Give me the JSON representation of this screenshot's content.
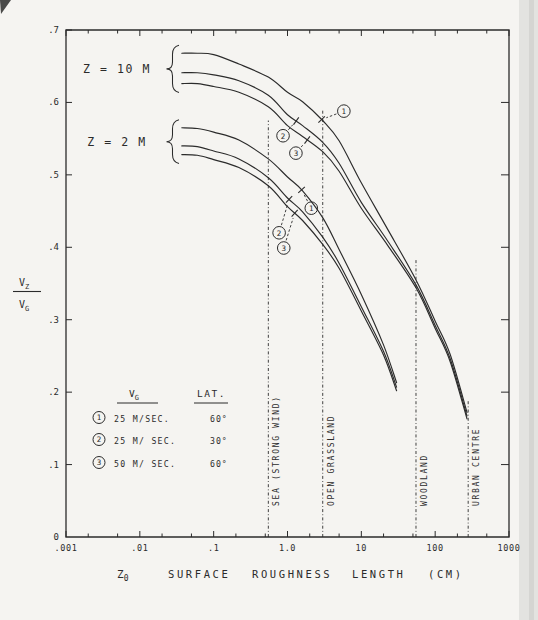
{
  "figure": {
    "background": "#f5f4f1",
    "ink": "#2b2b2b",
    "edge_band": "#e3e3e0",
    "edge_band_dark": "#d0d0cd"
  },
  "chart_data": {
    "type": "line",
    "title": "",
    "x_axis": {
      "scale": "log",
      "min": 0.001,
      "max": 1000,
      "decade_labels": [
        ".001",
        ".01",
        ".1",
        "1.0",
        "10",
        "100",
        "1000"
      ],
      "minor_tick_multiples": [
        2,
        5
      ],
      "title_parts": {
        "symbol": "Z",
        "symbol_sub": "0",
        "words": [
          "SURFACE",
          "ROUGHNESS",
          "LENGTH",
          "(CM)"
        ]
      }
    },
    "y_axis": {
      "min": 0,
      "max": 0.7,
      "step": 0.1,
      "tick_labels": [
        "0",
        ".1",
        ".2",
        ".3",
        ".4",
        ".5",
        ".6",
        ".7"
      ],
      "label": {
        "numerator": "V",
        "numerator_sub": "Z",
        "denominator": "V",
        "denominator_sub": "G"
      }
    },
    "groups": [
      {
        "label": "Z = 10 M",
        "series_indexes": [
          0,
          1,
          2
        ]
      },
      {
        "label": "Z = 2 M",
        "series_indexes": [
          3,
          4,
          5
        ]
      }
    ],
    "series": [
      {
        "name": "Z=10M, VG 25 M/SEC, LAT 60",
        "num": "1",
        "points": [
          [
            0.037,
            0.668
          ],
          [
            0.06,
            0.668
          ],
          [
            0.1,
            0.666
          ],
          [
            0.22,
            0.653
          ],
          [
            0.55,
            0.635
          ],
          [
            1.0,
            0.614
          ],
          [
            1.6,
            0.601
          ],
          [
            3,
            0.575
          ],
          [
            5,
            0.547
          ],
          [
            10,
            0.489
          ],
          [
            23,
            0.424
          ],
          [
            55,
            0.355
          ],
          [
            100,
            0.298
          ],
          [
            160,
            0.252
          ],
          [
            270,
            0.172
          ]
        ]
      },
      {
        "name": "Z=10M, VG 25 M/SEC, LAT 30",
        "num": "2",
        "points": [
          [
            0.037,
            0.641
          ],
          [
            0.06,
            0.641
          ],
          [
            0.1,
            0.638
          ],
          [
            0.22,
            0.63
          ],
          [
            0.55,
            0.61
          ],
          [
            1.0,
            0.583
          ],
          [
            1.6,
            0.568
          ],
          [
            3,
            0.545
          ],
          [
            5,
            0.516
          ],
          [
            10,
            0.462
          ],
          [
            23,
            0.408
          ],
          [
            55,
            0.348
          ],
          [
            100,
            0.292
          ],
          [
            160,
            0.246
          ],
          [
            270,
            0.167
          ]
        ]
      },
      {
        "name": "Z=10M, VG 50 M/SEC, LAT 60",
        "num": "3",
        "points": [
          [
            0.037,
            0.626
          ],
          [
            0.06,
            0.626
          ],
          [
            0.1,
            0.622
          ],
          [
            0.22,
            0.614
          ],
          [
            0.55,
            0.594
          ],
          [
            1.0,
            0.568
          ],
          [
            1.6,
            0.553
          ],
          [
            3,
            0.532
          ],
          [
            5,
            0.505
          ],
          [
            10,
            0.454
          ],
          [
            23,
            0.402
          ],
          [
            55,
            0.344
          ],
          [
            100,
            0.288
          ],
          [
            160,
            0.242
          ],
          [
            270,
            0.163
          ]
        ]
      },
      {
        "name": "Z=2M, VG 25 M/SEC, LAT 60",
        "num": "1",
        "points": [
          [
            0.037,
            0.565
          ],
          [
            0.06,
            0.564
          ],
          [
            0.1,
            0.559
          ],
          [
            0.22,
            0.548
          ],
          [
            0.55,
            0.522
          ],
          [
            1.0,
            0.497
          ],
          [
            1.6,
            0.478
          ],
          [
            3,
            0.441
          ],
          [
            5,
            0.397
          ],
          [
            10,
            0.335
          ],
          [
            20,
            0.265
          ],
          [
            30,
            0.213
          ]
        ]
      },
      {
        "name": "Z=2M, VG 25 M/SEC, LAT 30",
        "num": "2",
        "points": [
          [
            0.037,
            0.54
          ],
          [
            0.06,
            0.539
          ],
          [
            0.1,
            0.533
          ],
          [
            0.22,
            0.522
          ],
          [
            0.55,
            0.496
          ],
          [
            1.0,
            0.468
          ],
          [
            1.6,
            0.449
          ],
          [
            3,
            0.414
          ],
          [
            5,
            0.378
          ],
          [
            10,
            0.318
          ],
          [
            20,
            0.256
          ],
          [
            30,
            0.207
          ]
        ]
      },
      {
        "name": "Z=2M, VG 50 M/SEC, LAT 60",
        "num": "3",
        "points": [
          [
            0.037,
            0.528
          ],
          [
            0.06,
            0.527
          ],
          [
            0.1,
            0.521
          ],
          [
            0.22,
            0.51
          ],
          [
            0.55,
            0.485
          ],
          [
            1.0,
            0.456
          ],
          [
            1.6,
            0.437
          ],
          [
            3,
            0.404
          ],
          [
            5,
            0.371
          ],
          [
            10,
            0.312
          ],
          [
            20,
            0.251
          ],
          [
            30,
            0.202
          ]
        ]
      }
    ],
    "annotations": [
      {
        "num": "1",
        "series": 0,
        "circle": {
          "x": 5.8,
          "y": 0.588
        },
        "target_x": 2.9
      },
      {
        "num": "2",
        "series": 1,
        "circle": {
          "x": 0.87,
          "y": 0.554
        },
        "target_x": 1.31
      },
      {
        "num": "3",
        "series": 2,
        "circle": {
          "x": 1.3,
          "y": 0.53
        },
        "target_x": 1.85
      },
      {
        "num": "1",
        "series": 3,
        "circle": {
          "x": 2.1,
          "y": 0.454
        },
        "target_x": 1.55
      },
      {
        "num": "2",
        "series": 4,
        "circle": {
          "x": 0.77,
          "y": 0.42
        },
        "target_x": 1.05
      },
      {
        "num": "3",
        "series": 5,
        "circle": {
          "x": 0.89,
          "y": 0.399
        },
        "target_x": 1.25
      }
    ],
    "reference_lines": [
      {
        "label": "SEA  (STRONG  WIND)",
        "x": 0.55,
        "top": 0.575
      },
      {
        "label": "OPEN  GRASSLAND",
        "x": 3,
        "top": 0.59
      },
      {
        "label": "WOODLAND",
        "x": 55,
        "top": 0.383
      },
      {
        "label": "URBAN  CENTRE",
        "x": 280,
        "top": 0.19
      }
    ],
    "legend": {
      "col_v": {
        "base": "V",
        "sub": "G"
      },
      "col_lat": "LAT.",
      "rows": [
        {
          "num": "1",
          "vg": "25 M/SEC.",
          "lat": "60°"
        },
        {
          "num": "2",
          "vg": "25 M/ SEC.",
          "lat": "30°"
        },
        {
          "num": "3",
          "vg": "50 M/ SEC.",
          "lat": "60°"
        }
      ]
    }
  }
}
